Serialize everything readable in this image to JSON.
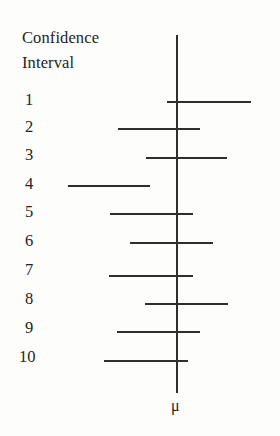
{
  "figure": {
    "header": {
      "line1": "Confidence",
      "line2": "Interval"
    },
    "axis_label": "μ",
    "colors": {
      "background": "#fdfdfb",
      "line": "#2e2e2e",
      "text": "#242424"
    }
  },
  "chart_data": {
    "type": "line",
    "title": "Confidence Interval",
    "xlabel": "μ",
    "ylabel": "Confidence Interval",
    "grid": false,
    "legend": null,
    "axis": {
      "mu_x": 176,
      "mu_tick_label": "μ",
      "vertical_line_top": 35,
      "vertical_line_bottom": 393
    },
    "categories": [
      "1",
      "2",
      "3",
      "4",
      "5",
      "6",
      "7",
      "8",
      "9",
      "10"
    ],
    "intervals": [
      {
        "label": "1",
        "x_start": 167,
        "x_end": 251,
        "y": 101,
        "contains_mu": true,
        "label_x": 25,
        "label_y": 92
      },
      {
        "label": "2",
        "x_start": 118,
        "x_end": 200,
        "y": 128,
        "contains_mu": true,
        "label_x": 25,
        "label_y": 119
      },
      {
        "label": "3",
        "x_start": 146,
        "x_end": 227,
        "y": 157,
        "contains_mu": true,
        "label_x": 25,
        "label_y": 147
      },
      {
        "label": "4",
        "x_start": 68,
        "x_end": 150,
        "y": 185,
        "contains_mu": false,
        "label_x": 25,
        "label_y": 176
      },
      {
        "label": "5",
        "x_start": 110,
        "x_end": 193,
        "y": 213,
        "contains_mu": true,
        "label_x": 25,
        "label_y": 204
      },
      {
        "label": "6",
        "x_start": 130,
        "x_end": 213,
        "y": 242,
        "contains_mu": true,
        "label_x": 25,
        "label_y": 233
      },
      {
        "label": "7",
        "x_start": 109,
        "x_end": 193,
        "y": 275,
        "contains_mu": true,
        "label_x": 25,
        "label_y": 262
      },
      {
        "label": "8",
        "x_start": 145,
        "x_end": 228,
        "y": 303,
        "contains_mu": true,
        "label_x": 25,
        "label_y": 291
      },
      {
        "label": "9",
        "x_start": 117,
        "x_end": 200,
        "y": 331,
        "contains_mu": true,
        "label_x": 25,
        "label_y": 320
      },
      {
        "label": "10",
        "x_start": 104,
        "x_end": 188,
        "y": 360,
        "contains_mu": true,
        "label_x": 19,
        "label_y": 349
      }
    ],
    "mu_symbol_position": {
      "x": 171,
      "y": 398
    }
  }
}
